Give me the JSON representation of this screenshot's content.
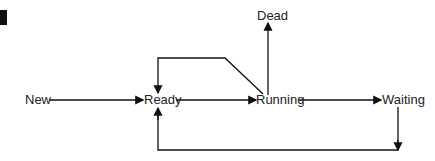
{
  "diagram": {
    "type": "state-transition",
    "states": {
      "new": "New",
      "ready": "Ready",
      "running": "Running",
      "dead": "Dead",
      "waiting": "Waiting"
    },
    "transitions": [
      {
        "from": "New",
        "to": "Ready"
      },
      {
        "from": "Ready",
        "to": "Running"
      },
      {
        "from": "Running",
        "to": "Ready"
      },
      {
        "from": "Running",
        "to": "Dead"
      },
      {
        "from": "Running",
        "to": "Waiting"
      },
      {
        "from": "Waiting",
        "to": "Ready"
      }
    ],
    "line_color": "#111111"
  }
}
